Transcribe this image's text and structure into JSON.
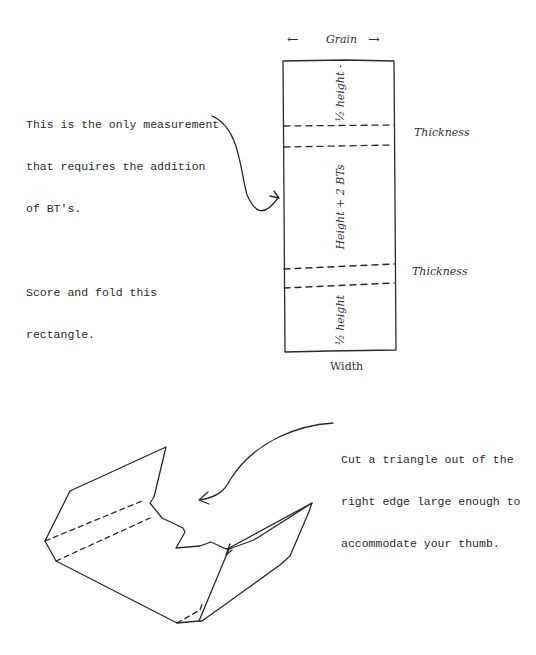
{
  "top_diagram": {
    "grain_label": "Grain",
    "grain_arrow_left": "←",
    "grain_arrow_right": "→",
    "note_lines": [
      "This is the only measurement",
      "that requires the addition",
      "of BT's.",
      "",
      "Score and fold this",
      "rectangle."
    ],
    "sections": [
      {
        "label": "½ height -"
      },
      {
        "label": "Height + 2 BTs"
      },
      {
        "label": "½ height"
      }
    ],
    "thickness_labels": [
      "Thickness",
      "Thickness"
    ],
    "width_label": "Width"
  },
  "bottom_diagram": {
    "note_lines": [
      "Cut a triangle out of the",
      "right edge large enough to",
      "accommodate your thumb."
    ]
  },
  "colors": {
    "ink": "#2b2b2b",
    "background": "#ffffff"
  }
}
